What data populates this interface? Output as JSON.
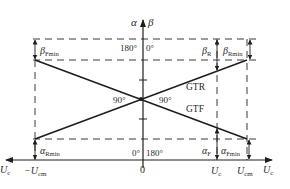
{
  "diagram": {
    "title": "",
    "axes": {
      "vertical_label_left": "α",
      "vertical_label_right": "β",
      "horizontal_label_left": "U",
      "horizontal_label_left_sub": "c",
      "horizontal_label_right": "U",
      "horizontal_label_right_sub": "c",
      "origin": "0"
    },
    "ticks": {
      "neg_ucm": "−U",
      "neg_ucm_sub": "cm",
      "uc": "U",
      "uc_sub": "c",
      "ucm": "U",
      "ucm_sub": "cm"
    },
    "angles": {
      "top_left": "180°",
      "top_right": "0°",
      "center_left": "90°",
      "center_right": "90°",
      "bottom_left": "0°",
      "bottom_right": "180°"
    },
    "curves": {
      "gtr": "GTR",
      "gtf": "GTF"
    },
    "dimensions": {
      "beta_fmin": "β",
      "beta_fmin_sub": "Fmin",
      "alpha_rmin": "α",
      "alpha_rmin_sub": "Rmin",
      "beta_r": "β",
      "beta_r_sub": "R",
      "beta_rmin": "β",
      "beta_rmin_sub": "Rmin",
      "alpha_f": "α",
      "alpha_f_sub": "F",
      "alpha_fmin": "α",
      "alpha_fmin_sub": "Fmin"
    }
  }
}
